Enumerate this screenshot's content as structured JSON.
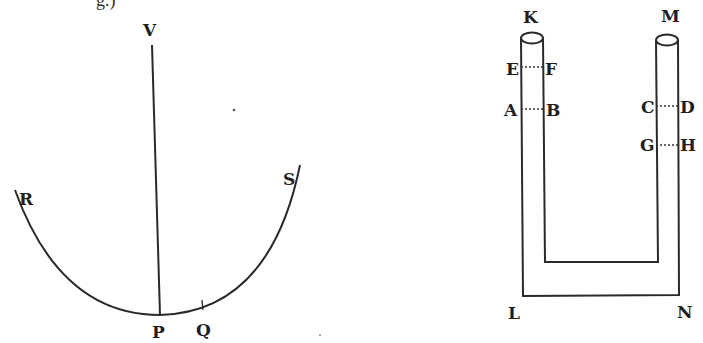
{
  "top_fragment": "g.)",
  "figure_pendulum": {
    "labels": {
      "V": "V",
      "R": "R",
      "S": "S",
      "P": "P",
      "Q": "Q"
    }
  },
  "figure_u_tube": {
    "labels": {
      "K": "K",
      "M": "M",
      "E": "E",
      "F": "F",
      "A": "A",
      "B": "B",
      "C": "C",
      "D": "D",
      "G": "G",
      "H": "H",
      "L": "L",
      "N": "N"
    }
  }
}
